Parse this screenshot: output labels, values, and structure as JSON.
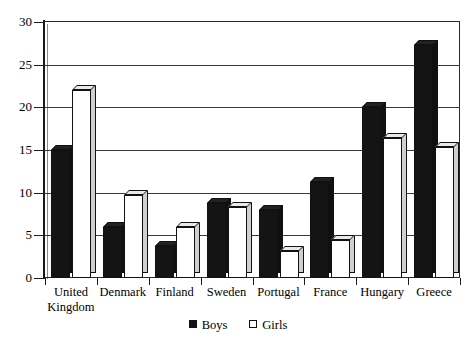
{
  "chart_data": {
    "type": "bar",
    "title": "",
    "subtitle": "",
    "xlabel": "",
    "ylabel": "",
    "ylim": [
      0,
      30
    ],
    "y_ticks": [
      0,
      5,
      10,
      15,
      20,
      25,
      30
    ],
    "grid": true,
    "legend_position": "bottom-center",
    "categories": [
      "United Kingdom",
      "Denmark",
      "Finland",
      "Sweden",
      "Portugal",
      "France",
      "Hungary",
      "Greece"
    ],
    "category_lines": [
      [
        "United",
        "Kingdom"
      ],
      [
        "Denmark",
        ""
      ],
      [
        "Finland",
        ""
      ],
      [
        "Sweden",
        ""
      ],
      [
        "Portugal",
        ""
      ],
      [
        "France",
        ""
      ],
      [
        "Hungary",
        ""
      ],
      [
        "Greece",
        ""
      ]
    ],
    "series": [
      {
        "name": "Boys",
        "color": "#141414",
        "values": [
          15.0,
          6.0,
          3.7,
          8.8,
          8.0,
          11.2,
          20.0,
          27.3
        ]
      },
      {
        "name": "Girls",
        "color": "#ffffff",
        "values": [
          22.0,
          9.7,
          6.0,
          8.3,
          3.2,
          4.4,
          16.4,
          15.3
        ]
      }
    ]
  },
  "legend": {
    "items": [
      {
        "label": "Boys",
        "swatch": "filled-square-icon"
      },
      {
        "label": "Girls",
        "swatch": "hollow-square-icon"
      }
    ]
  },
  "axis": {
    "y_tick_labels": [
      "0",
      "5",
      "10",
      "15",
      "20",
      "25",
      "30"
    ]
  }
}
